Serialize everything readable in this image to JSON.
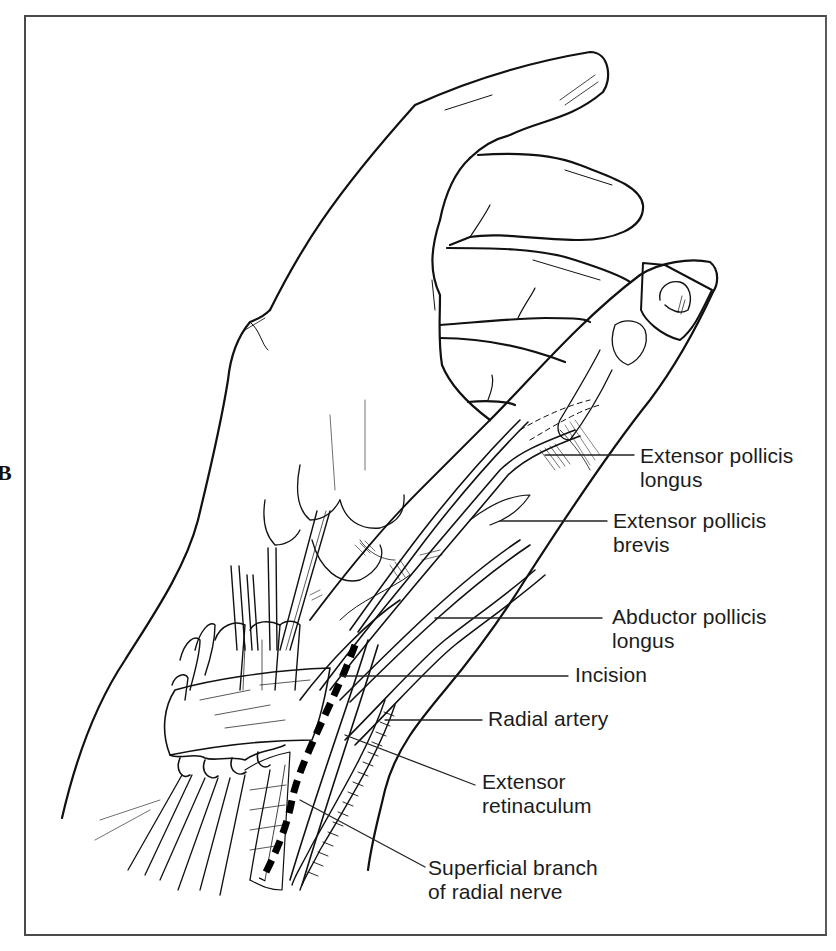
{
  "figure": {
    "panel_letter": "B",
    "colors": {
      "line": "#111111",
      "frame": "#4a4a4a",
      "background": "#ffffff",
      "incision": "#000000"
    }
  },
  "labels": [
    {
      "id": "epl",
      "lines": [
        "Extensor pollicis",
        "longus"
      ]
    },
    {
      "id": "epb",
      "lines": [
        "Extensor pollicis",
        "brevis"
      ]
    },
    {
      "id": "apl",
      "lines": [
        "Abductor pollicis",
        "longus"
      ]
    },
    {
      "id": "incision",
      "lines": [
        "Incision"
      ]
    },
    {
      "id": "radial-artery",
      "lines": [
        "Radial artery"
      ]
    },
    {
      "id": "extensor-retinaculum",
      "lines": [
        "Extensor",
        "retinaculum"
      ]
    },
    {
      "id": "superficial-radial-nerve",
      "lines": [
        "Superficial branch",
        "of radial nerve"
      ]
    }
  ]
}
